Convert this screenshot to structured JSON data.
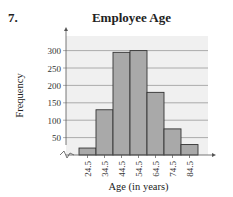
{
  "problem_number": "7.",
  "chart_data": {
    "type": "bar",
    "title": "Employee Age",
    "xlabel": "Age (in years)",
    "ylabel": "Frequency",
    "categories": [
      "24.5",
      "34.5",
      "44.5",
      "54.5",
      "64.5",
      "74.5",
      "84.5"
    ],
    "values": [
      20,
      130,
      295,
      300,
      180,
      75,
      30
    ],
    "yticks": [
      50,
      100,
      150,
      200,
      250,
      300
    ],
    "ylim": [
      0,
      340
    ],
    "grid": true,
    "axis_break": true,
    "histogram": true,
    "colors": {
      "bar": "#a9a9a9",
      "bar_edge": "#333333",
      "plot_bg": "#f0f0f0",
      "grid": "#999999"
    }
  }
}
